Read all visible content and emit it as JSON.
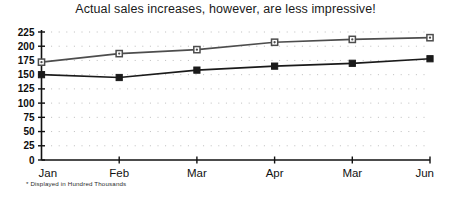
{
  "chart_data": {
    "type": "line",
    "title": "Actual sales increases, however, are less impressive!",
    "xlabel": "",
    "ylabel": "",
    "categories": [
      "Jan",
      "Feb",
      "Mar",
      "Apr",
      "Mar",
      "Jun"
    ],
    "ylim": [
      0,
      225
    ],
    "yticks": [
      0,
      25,
      50,
      75,
      100,
      125,
      150,
      175,
      200,
      225
    ],
    "ytick_labels": [
      "0",
      "25",
      "50",
      "75",
      "100",
      "125",
      "150",
      "175",
      "200",
      "225"
    ],
    "grid": true,
    "grid_style": "dotted",
    "legend": false,
    "footnote": "* Displayed in Hundred Thousands",
    "series": [
      {
        "name": "upper-series",
        "marker": "circle-open",
        "color": "#4d4d4d",
        "values": [
          172,
          187,
          194,
          207,
          212,
          215
        ]
      },
      {
        "name": "lower-series",
        "marker": "square-filled",
        "color": "#1a1a1a",
        "values": [
          150,
          145,
          158,
          165,
          170,
          178
        ]
      }
    ]
  },
  "colors": {
    "background": "#ffffff",
    "axis": "#111111",
    "grid": "#bdbdbd",
    "text": "#111111"
  }
}
